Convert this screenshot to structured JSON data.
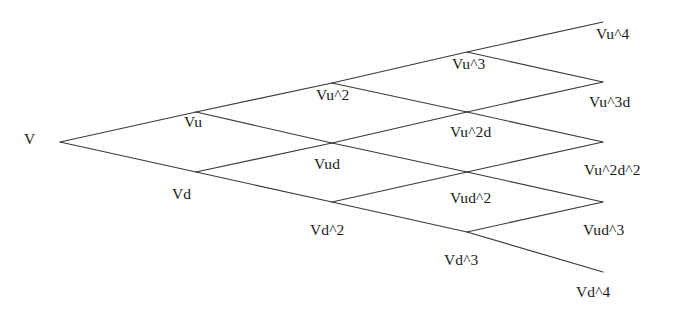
{
  "diagram": {
    "type": "binomial-lattice",
    "title": "",
    "background_color": "#ffffff",
    "line_color": "#3a3a3c",
    "text_color": "#1b1b1d",
    "steps": 4,
    "geometry": {
      "origin_x": 60,
      "origin_y": 142,
      "x_step": 136,
      "y_step": 30
    },
    "nodes": [
      {
        "id": "n0_0",
        "label": "V",
        "level": 0,
        "ups": 0,
        "x": 60,
        "y": 142,
        "label_x": 24,
        "label_y": 131,
        "terminal": false
      },
      {
        "id": "n1_1",
        "label": "Vu",
        "level": 1,
        "ups": 1,
        "x": 196,
        "y": 112,
        "label_x": 184,
        "label_y": 114,
        "terminal": false
      },
      {
        "id": "n1_0",
        "label": "Vd",
        "level": 1,
        "ups": 0,
        "x": 196,
        "y": 172,
        "label_x": 172,
        "label_y": 186,
        "terminal": false
      },
      {
        "id": "n2_2",
        "label": "Vu^2",
        "level": 2,
        "ups": 2,
        "x": 332,
        "y": 83,
        "label_x": 316,
        "label_y": 87,
        "terminal": false
      },
      {
        "id": "n2_1",
        "label": "Vud",
        "level": 2,
        "ups": 1,
        "x": 332,
        "y": 143,
        "label_x": 314,
        "label_y": 156,
        "terminal": false
      },
      {
        "id": "n2_0",
        "label": "Vd^2",
        "level": 2,
        "ups": 0,
        "x": 332,
        "y": 202,
        "label_x": 310,
        "label_y": 222,
        "terminal": false
      },
      {
        "id": "n3_3",
        "label": "Vu^3",
        "level": 3,
        "ups": 3,
        "x": 467,
        "y": 52,
        "label_x": 452,
        "label_y": 56,
        "terminal": false
      },
      {
        "id": "n3_2",
        "label": "Vu^2d",
        "level": 3,
        "ups": 2,
        "x": 467,
        "y": 112,
        "label_x": 450,
        "label_y": 124,
        "terminal": false
      },
      {
        "id": "n3_1",
        "label": "Vud^2",
        "level": 3,
        "ups": 1,
        "x": 467,
        "y": 172,
        "label_x": 450,
        "label_y": 190,
        "terminal": false
      },
      {
        "id": "n3_0",
        "label": "Vd^3",
        "level": 3,
        "ups": 0,
        "x": 467,
        "y": 232,
        "label_x": 444,
        "label_y": 252,
        "terminal": false
      },
      {
        "id": "n4_4",
        "label": "Vu^4",
        "level": 4,
        "ups": 4,
        "x": 603,
        "y": 22,
        "label_x": 596,
        "label_y": 26,
        "terminal": true
      },
      {
        "id": "n4_3",
        "label": "Vu^3d",
        "level": 4,
        "ups": 3,
        "x": 603,
        "y": 82,
        "label_x": 589,
        "label_y": 94,
        "terminal": true
      },
      {
        "id": "n4_2",
        "label": "Vu^2d^2",
        "level": 4,
        "ups": 2,
        "x": 603,
        "y": 142,
        "label_x": 584,
        "label_y": 162,
        "terminal": true
      },
      {
        "id": "n4_1",
        "label": "Vud^3",
        "level": 4,
        "ups": 1,
        "x": 603,
        "y": 202,
        "label_x": 583,
        "label_y": 222,
        "terminal": true
      },
      {
        "id": "n4_0",
        "label": "Vd^4",
        "level": 4,
        "ups": 0,
        "x": 603,
        "y": 272,
        "label_x": 576,
        "label_y": 284,
        "terminal": true
      }
    ],
    "edges": [
      {
        "from": "n0_0",
        "to": "n1_1",
        "move": "up"
      },
      {
        "from": "n0_0",
        "to": "n1_0",
        "move": "down"
      },
      {
        "from": "n1_1",
        "to": "n2_2",
        "move": "up"
      },
      {
        "from": "n1_1",
        "to": "n2_1",
        "move": "down"
      },
      {
        "from": "n1_0",
        "to": "n2_1",
        "move": "up"
      },
      {
        "from": "n1_0",
        "to": "n2_0",
        "move": "down"
      },
      {
        "from": "n2_2",
        "to": "n3_3",
        "move": "up"
      },
      {
        "from": "n2_2",
        "to": "n3_2",
        "move": "down"
      },
      {
        "from": "n2_1",
        "to": "n3_2",
        "move": "up"
      },
      {
        "from": "n2_1",
        "to": "n3_1",
        "move": "down"
      },
      {
        "from": "n2_0",
        "to": "n3_1",
        "move": "up"
      },
      {
        "from": "n2_0",
        "to": "n3_0",
        "move": "down"
      },
      {
        "from": "n3_3",
        "to": "n4_4",
        "move": "up"
      },
      {
        "from": "n3_3",
        "to": "n4_3",
        "move": "down"
      },
      {
        "from": "n3_2",
        "to": "n4_3",
        "move": "up"
      },
      {
        "from": "n3_2",
        "to": "n4_2",
        "move": "down"
      },
      {
        "from": "n3_1",
        "to": "n4_2",
        "move": "up"
      },
      {
        "from": "n3_1",
        "to": "n4_1",
        "move": "down"
      },
      {
        "from": "n3_0",
        "to": "n4_1",
        "move": "up"
      },
      {
        "from": "n3_0",
        "to": "n4_0",
        "move": "down"
      }
    ]
  }
}
